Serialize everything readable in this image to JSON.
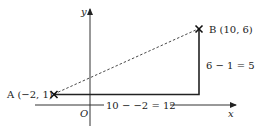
{
  "diagram": {
    "axes": {
      "x_label": "x",
      "y_label": "y",
      "origin_label": "O"
    },
    "points": [
      {
        "name": "A",
        "label": "A (−2, 1)",
        "x": -2,
        "y": 1
      },
      {
        "name": "B",
        "label": "B (10, 6)",
        "x": 10,
        "y": 6
      }
    ],
    "horizontal_distance_label": "10 − −2 = 12",
    "vertical_distance_label": "6 − 1 = 5",
    "colors": {
      "line": "#222222",
      "background": "#ffffff"
    }
  }
}
